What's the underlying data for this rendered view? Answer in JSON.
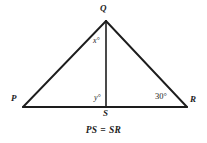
{
  "figure": {
    "type": "geometry-diagram",
    "shape": "triangle-with-altitude",
    "background_color": "#ffffff",
    "stroke_color": "#1d1d1d",
    "vertices": [
      {
        "name": "Q",
        "label": "Q",
        "x": 106,
        "y": 21,
        "role": "apex"
      },
      {
        "name": "P",
        "label": "P",
        "x": 23,
        "y": 107,
        "role": "base-left"
      },
      {
        "name": "R",
        "label": "R",
        "x": 187,
        "y": 107,
        "role": "base-right"
      },
      {
        "name": "S",
        "label": "S",
        "x": 106,
        "y": 107,
        "role": "foot-of-altitude"
      }
    ],
    "segments": [
      {
        "name": "PQ",
        "from": "P",
        "to": "Q",
        "width": 1.9
      },
      {
        "name": "QR",
        "from": "Q",
        "to": "R",
        "width": 1.9
      },
      {
        "name": "PR",
        "from": "P",
        "to": "R",
        "width": 1.9
      },
      {
        "name": "QS",
        "from": "Q",
        "to": "S",
        "width": 1.6
      }
    ],
    "angle_labels": [
      {
        "name": "angle-x-at-q",
        "text": "x°",
        "x": 93,
        "y": 37
      },
      {
        "name": "angle-y-at-s",
        "text": "y°",
        "x": 94,
        "y": 94
      },
      {
        "name": "angle-at-r",
        "text": "30°",
        "x": 155,
        "y": 92
      }
    ],
    "caption": "PS = SR"
  }
}
